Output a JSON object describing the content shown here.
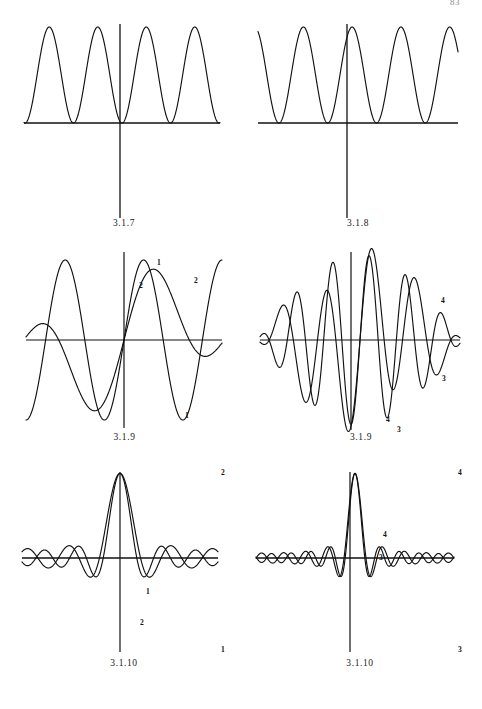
{
  "page": {
    "number": "83",
    "background": "#ffffff",
    "ink_color": "#111111",
    "width": 482,
    "height": 709
  },
  "figures": [
    {
      "id": "fig-3-1-7",
      "caption": "3.1.7",
      "position": {
        "left": 24,
        "top": 18,
        "width": 200,
        "height": 112
      },
      "axes": {
        "x_axis": true,
        "y_axis": true,
        "y_axis_extends_below": true
      },
      "chart_data": {
        "type": "line",
        "title": "3.1.7",
        "xlabel": "",
        "ylabel": "",
        "grid": false,
        "legend": "none",
        "xlim": [
          -2.0,
          2.0
        ],
        "ylim": [
          0.0,
          1.0
        ],
        "series": [
          {
            "name": "1",
            "label": "",
            "formula": "sin(x)^2 scaled: y = sin(2*pi*x)^2 over four humps, zero at x=0",
            "amplitude": 1.0,
            "period": 1.0,
            "phase": 0.0,
            "rectified": true,
            "humps": 4,
            "zero_at_origin": true
          }
        ],
        "annotations": []
      }
    },
    {
      "id": "fig-3-1-8",
      "caption": "3.1.8",
      "position": {
        "left": 258,
        "top": 18,
        "width": 200,
        "height": 112
      },
      "axes": {
        "x_axis": true,
        "y_axis": true,
        "y_axis_extends_below": true
      },
      "chart_data": {
        "type": "line",
        "title": "3.1.8",
        "xlabel": "",
        "ylabel": "",
        "grid": false,
        "legend": "none",
        "xlim": [
          -2.0,
          2.0
        ],
        "ylim": [
          0.0,
          1.0
        ],
        "series": [
          {
            "name": "1",
            "label": "",
            "formula": "cos(x)^2 scaled: y = cos(2*pi*x)^2, peak at x=0",
            "amplitude": 1.0,
            "period": 1.0,
            "phase": 0.5,
            "rectified": true,
            "humps": 5,
            "peak_at_origin": true
          }
        ],
        "annotations": []
      }
    },
    {
      "id": "fig-3-1-9-left",
      "caption": "3.1.9",
      "position": {
        "left": 24,
        "top": 250,
        "width": 200,
        "height": 180
      },
      "axes": {
        "x_axis": true,
        "y_axis": true
      },
      "chart_data": {
        "type": "line",
        "title": "3.1.9",
        "xlabel": "",
        "ylabel": "",
        "grid": false,
        "legend": "curve-end-labels",
        "xlim": [
          -1.0,
          1.0
        ],
        "ylim": [
          -1.25,
          1.25
        ],
        "series": [
          {
            "name": "1",
            "label": "1",
            "formula": "partial Fourier sum, odd term, 2.5 periods",
            "harmonics": [
              {
                "k": 1,
                "a": 1.0
              }
            ],
            "envelope": "none",
            "label_points": [
              {
                "x": 0.3,
                "y": 1.0,
                "text": "1"
              },
              {
                "x": 0.78,
                "y": -1.0,
                "text": "1"
              }
            ]
          },
          {
            "name": "2",
            "label": "2",
            "formula": "partial Fourier sum with envelope, two-term",
            "harmonics": [
              {
                "k": 1,
                "a": 0.55
              },
              {
                "k": 3,
                "a": 0.45
              }
            ],
            "envelope": "sin",
            "label_points": [
              {
                "x": 0.18,
                "y": 0.76,
                "text": "2"
              },
              {
                "x": 0.7,
                "y": 0.78,
                "text": "2"
              }
            ]
          }
        ],
        "annotations": [
          {
            "text": "1",
            "role": "curve-id"
          },
          {
            "text": "2",
            "role": "curve-id"
          }
        ]
      }
    },
    {
      "id": "fig-3-1-9-right",
      "caption": "3.1.9",
      "position": {
        "left": 258,
        "top": 250,
        "width": 200,
        "height": 180
      },
      "axes": {
        "x_axis": true,
        "y_axis": true
      },
      "chart_data": {
        "type": "line",
        "title": "3.1.9",
        "xlabel": "",
        "ylabel": "",
        "grid": false,
        "legend": "curve-end-labels",
        "xlim": [
          -1.0,
          1.0
        ],
        "ylim": [
          -1.35,
          1.35
        ],
        "series": [
          {
            "name": "3",
            "label": "3",
            "formula": "higher-order partial sum, 6 periods with envelope",
            "harmonics": [
              {
                "k": 5,
                "a": 1.0
              }
            ],
            "envelope": "sin",
            "label_points": [
              {
                "x": 0.62,
                "y": -1.15,
                "text": "3"
              },
              {
                "x": 0.86,
                "y": -0.62,
                "text": "3"
              }
            ]
          },
          {
            "name": "4",
            "label": "4",
            "formula": "higher-order partial sum, 6 periods, alternate phase",
            "harmonics": [
              {
                "k": 5,
                "a": 0.9
              },
              {
                "k": 2,
                "a": 0.3
              }
            ],
            "envelope": "sin",
            "label_points": [
              {
                "x": 0.55,
                "y": -1.05,
                "text": "4"
              },
              {
                "x": 0.85,
                "y": 0.6,
                "text": "4"
              }
            ]
          }
        ],
        "annotations": [
          {
            "text": "3",
            "role": "curve-id"
          },
          {
            "text": "4",
            "role": "curve-id"
          }
        ]
      }
    },
    {
      "id": "fig-3-1-10-left",
      "caption": "3.1.10",
      "position": {
        "left": 24,
        "top": 462,
        "width": 200,
        "height": 190
      },
      "axes": {
        "x_axis": true,
        "y_axis": true
      },
      "chart_data": {
        "type": "line",
        "title": "3.1.10",
        "xlabel": "",
        "ylabel": "",
        "grid": false,
        "legend": "curve-end-labels",
        "xlim": [
          -1.0,
          1.0
        ],
        "ylim": [
          -2.0,
          2.6
        ],
        "series": [
          {
            "name": "1",
            "label": "1",
            "formula": "Dirichlet-type kernel, central peak, diverging tails",
            "central_peak": true,
            "peak_value": 2.4,
            "side_lobes": 4,
            "label_points": [
              {
                "x": 0.42,
                "y": -0.32,
                "text": "1"
              },
              {
                "x": 0.98,
                "y": -1.85,
                "text": "1"
              }
            ]
          },
          {
            "name": "2",
            "label": "2",
            "formula": "Dirichlet-type kernel, narrower central peak",
            "central_peak": true,
            "peak_value": 2.4,
            "side_lobes": 4,
            "label_points": [
              {
                "x": 0.4,
                "y": -0.95,
                "text": "2"
              },
              {
                "x": 0.98,
                "y": 2.3,
                "text": "2"
              }
            ]
          }
        ],
        "annotations": [
          {
            "text": "1",
            "role": "curve-id"
          },
          {
            "text": "2",
            "role": "curve-id"
          }
        ]
      }
    },
    {
      "id": "fig-3-1-10-right",
      "caption": "3.1.10",
      "position": {
        "left": 258,
        "top": 462,
        "width": 200,
        "height": 190
      },
      "axes": {
        "x_axis": true,
        "y_axis": true
      },
      "chart_data": {
        "type": "line",
        "title": "3.1.10",
        "xlabel": "",
        "ylabel": "",
        "grid": false,
        "legend": "curve-end-labels",
        "xlim": [
          -1.0,
          1.0
        ],
        "ylim": [
          -2.0,
          2.6
        ],
        "series": [
          {
            "name": "3",
            "label": "3",
            "formula": "higher-order Dirichlet kernel, central peak, many side lobes",
            "central_peak": true,
            "peak_value": 2.4,
            "side_lobes": 8,
            "label_points": [
              {
                "x": 0.44,
                "y": 0.28,
                "text": "3"
              },
              {
                "x": 0.98,
                "y": -1.85,
                "text": "3"
              }
            ]
          },
          {
            "name": "4",
            "label": "4",
            "formula": "higher-order Dirichlet kernel, alternate order",
            "central_peak": true,
            "peak_value": 2.4,
            "side_lobes": 8,
            "label_points": [
              {
                "x": 0.4,
                "y": 0.72,
                "text": "4"
              },
              {
                "x": 0.98,
                "y": 2.35,
                "text": "4"
              }
            ]
          }
        ],
        "annotations": [
          {
            "text": "3",
            "role": "curve-id"
          },
          {
            "text": "4",
            "role": "curve-id"
          }
        ]
      }
    }
  ]
}
